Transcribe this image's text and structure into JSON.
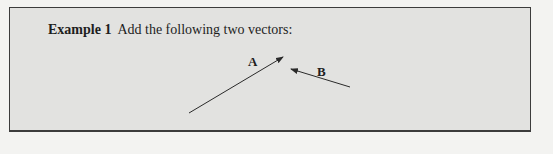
{
  "example": {
    "label": "Example 1",
    "prompt": "Add the following two vectors:"
  },
  "figure": {
    "vectors": [
      {
        "name": "A",
        "from": [
          189,
          113
        ],
        "to": [
          283,
          57
        ],
        "label_pos": [
          248,
          55
        ]
      },
      {
        "name": "B",
        "from": [
          350,
          87
        ],
        "to": [
          291,
          69
        ],
        "label_pos": [
          317,
          65
        ]
      }
    ],
    "stroke_color": "#2a2a2a"
  },
  "colors": {
    "box_background": "#e2e2e0",
    "page_background": "#f3f3f1",
    "border": "#3c3c3c"
  }
}
